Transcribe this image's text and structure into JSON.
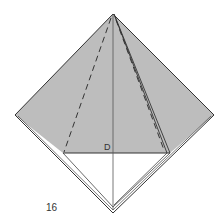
{
  "diagram": {
    "step_number": "16",
    "point_label": "D",
    "colors": {
      "paper_fill": "#bdbdbd",
      "line": "#333333",
      "background": "#ffffff"
    }
  }
}
